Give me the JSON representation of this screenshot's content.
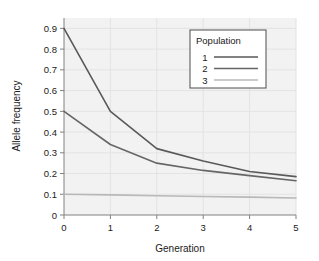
{
  "chart_data": {
    "type": "line",
    "title": "",
    "xlabel": "Generation",
    "ylabel": "Allele frequency",
    "x": [
      0,
      1,
      2,
      3,
      4,
      5
    ],
    "xlim": [
      0,
      5
    ],
    "ylim": [
      0,
      0.95
    ],
    "xticks": [
      "0",
      "1",
      "2",
      "3",
      "4",
      "5"
    ],
    "yticks": [
      "0",
      "0.1",
      "0.2",
      "0.3",
      "0.4",
      "0.5",
      "0.6",
      "0.7",
      "0.8",
      "0.9"
    ],
    "ytick_values": [
      0,
      0.1,
      0.2,
      0.3,
      0.4,
      0.5,
      0.6,
      0.7,
      0.8,
      0.9
    ],
    "grid": true,
    "legend_position": "upper right",
    "legend_title": "Population",
    "series": [
      {
        "name": "1",
        "color": "#595959",
        "values": [
          0.9,
          0.5,
          0.32,
          0.26,
          0.21,
          0.185
        ]
      },
      {
        "name": "2",
        "color": "#666666",
        "values": [
          0.5,
          0.34,
          0.25,
          0.215,
          0.19,
          0.165
        ]
      },
      {
        "name": "3",
        "color": "#b8b8b8",
        "values": [
          0.1,
          0.097,
          0.093,
          0.089,
          0.086,
          0.082
        ]
      }
    ]
  },
  "style": {
    "plot_background": "#f2f2f2",
    "grid_color": "#e3e3e3",
    "axis_color": "#808080",
    "text_color": "#1a1a1a",
    "legend_border": "#4d4d4d",
    "legend_background": "#ffffff"
  }
}
